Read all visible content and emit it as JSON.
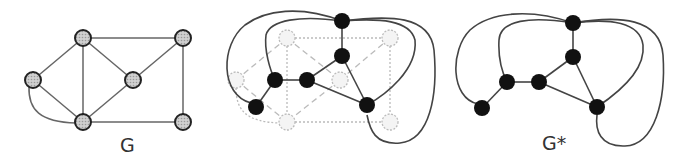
{
  "labels": {
    "graph": "G",
    "dual": "G*"
  },
  "colors": {
    "primal_fill": "#bdbdbd",
    "primal_stroke": "#333333",
    "dual_fill": "#111111",
    "edge": "#555555",
    "ghost": "#c8c8c8"
  },
  "primal_nodes": [
    "top-left",
    "top-right",
    "left",
    "center",
    "bottom-left",
    "bottom-right"
  ],
  "dual_nodes": [
    "outer-top",
    "inner-upper",
    "left-inner",
    "center-inner",
    "right-lower",
    "left-lower"
  ]
}
